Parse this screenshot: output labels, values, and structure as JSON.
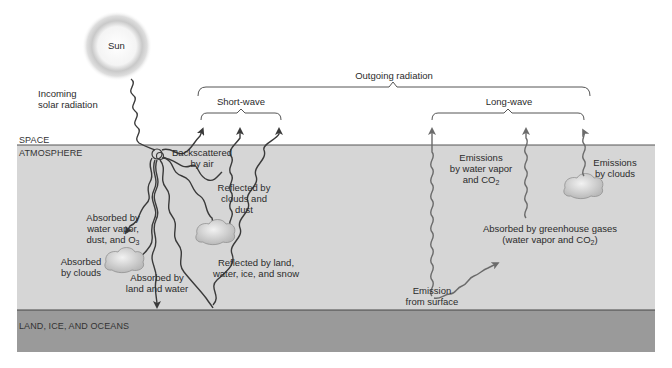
{
  "sun": {
    "label": "Sun"
  },
  "incoming": {
    "line1": "Incoming",
    "line2": "solar radiation"
  },
  "brackets": {
    "outgoing": "Outgoing radiation",
    "short_wave": "Short-wave",
    "long_wave": "Long-wave"
  },
  "layers": {
    "space": "SPACE",
    "atmosphere": "ATMOSPHERE",
    "surface": "LAND, ICE, AND OCEANS"
  },
  "colors": {
    "atmosphere": "#d6d6d6",
    "surface": "#9a9a9a",
    "wave": "#3a3a3a",
    "longwave": "#6b6b6b",
    "bracket": "#555555"
  },
  "shortwave_labels": {
    "backscattered": {
      "line1": "Backscattered",
      "line2": "by air"
    },
    "reflected_clouds": {
      "line1": "Reflected by",
      "line2": "clouds and",
      "line3": "dust"
    },
    "reflected_land": {
      "line1": "Reflected by land,",
      "line2": "water, ice, and snow"
    },
    "absorbed_vapor": {
      "line1": "Absorbed by",
      "line2": "water vapor,",
      "line3": "dust, and O",
      "sub": "3"
    },
    "absorbed_clouds": {
      "line1": "Absorbed",
      "line2": "by clouds"
    },
    "absorbed_land": {
      "line1": "Absorbed by",
      "line2": "land and water"
    }
  },
  "longwave_labels": {
    "emissions_vapor": {
      "line1": "Emissions",
      "line2": "by water vapor",
      "line3": "and CO",
      "sub": "2"
    },
    "emissions_clouds": {
      "line1": "Emissions",
      "line2": "by clouds"
    },
    "absorbed_ghg": {
      "line1": "Absorbed by greenhouse gases",
      "line2a": "(water vapor and CO",
      "sub": "2",
      "line2b": ")"
    },
    "emission_surface": {
      "line1": "Emission",
      "line2": "from surface"
    }
  }
}
